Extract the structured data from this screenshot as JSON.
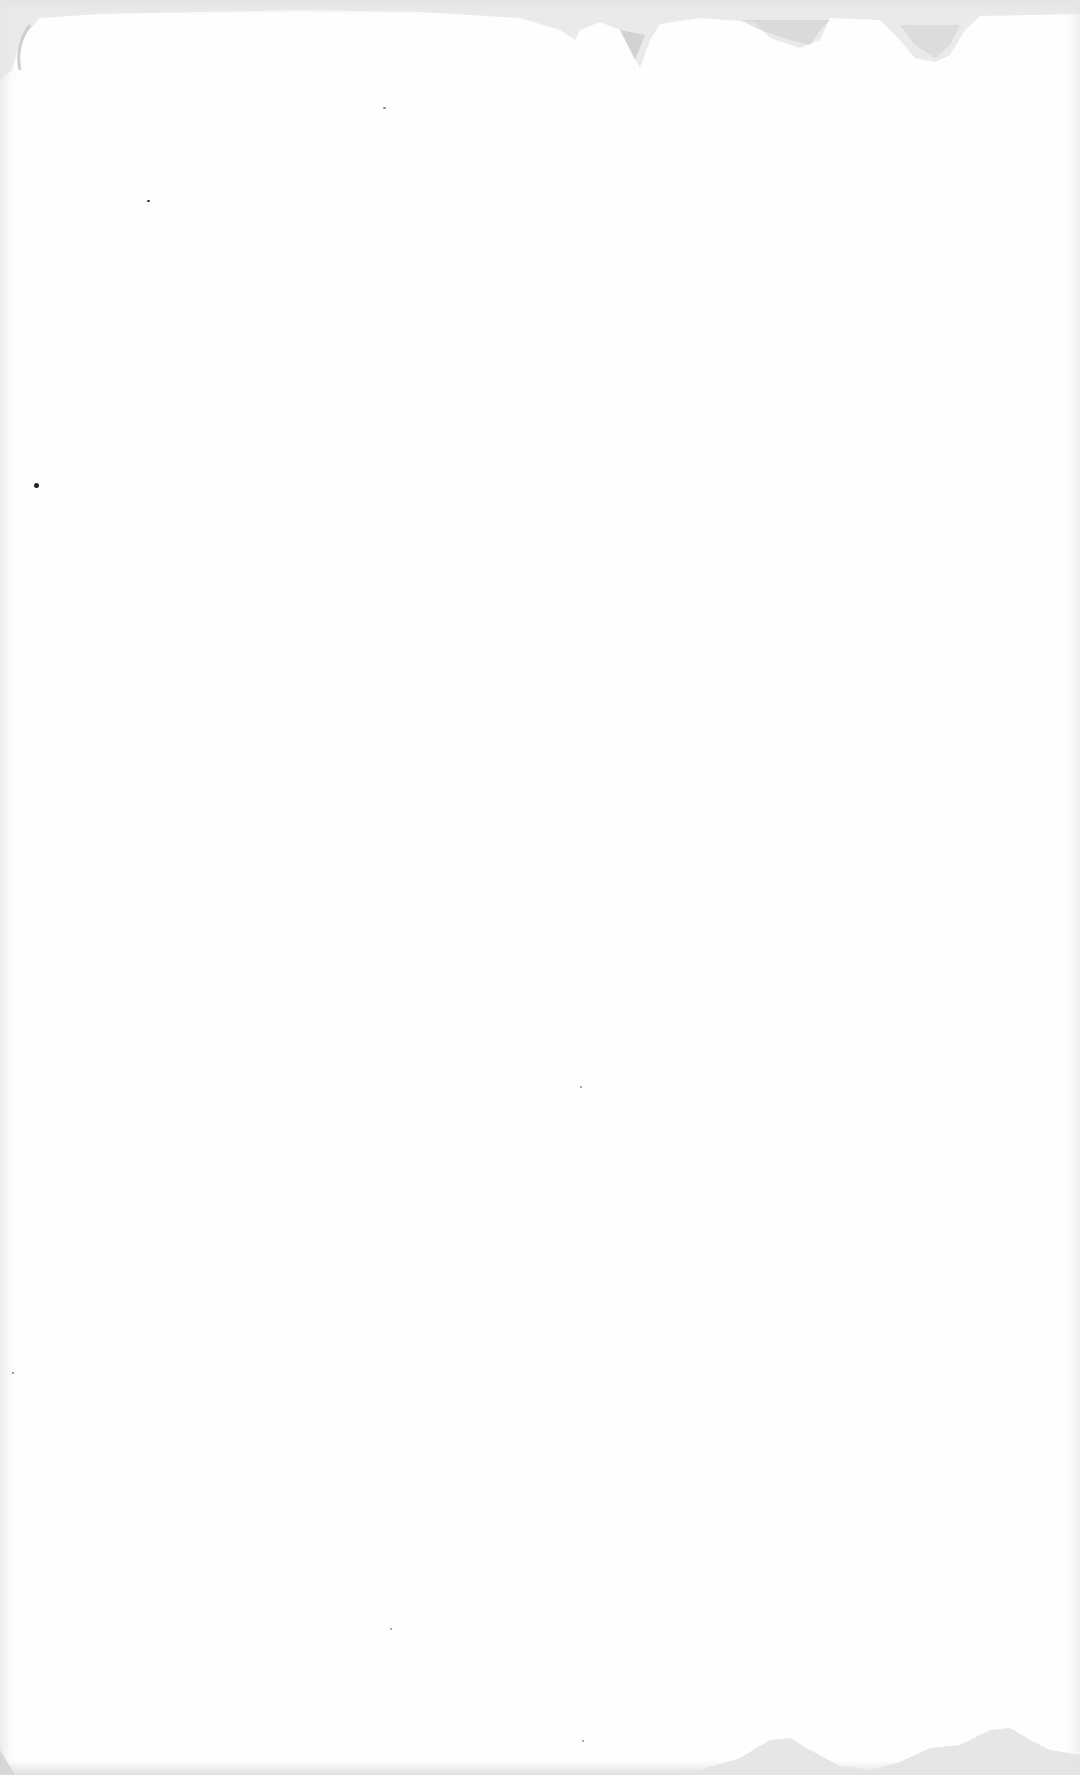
{
  "document": {
    "type": "blank-paper-scan",
    "text_content": "",
    "colors": {
      "paper": "#fefefe",
      "stain": "#c8c8c8",
      "speck": "#222222"
    }
  }
}
